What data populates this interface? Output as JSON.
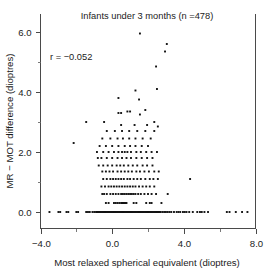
{
  "chart_data": {
    "type": "scatter",
    "title": "Infants under 3 months (n =478)",
    "xlabel": "Most relaxed spherical equivalent (dioptres)",
    "ylabel": "MR − MOT difference (dioptres)",
    "annotation": "r = −0.052",
    "correlation_r": -0.052,
    "n": 478,
    "xlim": [
      -4.0,
      8.0
    ],
    "ylim": [
      -0.55,
      6.6
    ],
    "xticks": [
      -4.0,
      0.0,
      4.0,
      8.0
    ],
    "xticklabels": [
      "−4.0",
      "0.0",
      "4.0",
      "8.0"
    ],
    "yticks": [
      0.0,
      2.0,
      4.0,
      6.0
    ],
    "yticklabels": [
      "0.0",
      "2.0",
      "4.0",
      "6.0"
    ],
    "x_minor_ticks": [
      -2.0,
      2.0,
      6.0
    ],
    "y_minor_ticks": [
      1.0,
      3.0,
      5.0
    ],
    "grid": false,
    "legend": "none",
    "marker": {
      "shape": "square",
      "size_px": 1.9,
      "color": "#111111"
    },
    "points": [
      [
        -3.5,
        0.0
      ],
      [
        -3.0,
        0.0
      ],
      [
        -2.9,
        0.0
      ],
      [
        -2.55,
        0.0
      ],
      [
        -2.45,
        0.0
      ],
      [
        -2.0,
        0.0
      ],
      [
        -1.9,
        0.0
      ],
      [
        -1.45,
        0.0
      ],
      [
        -1.35,
        0.0
      ],
      [
        -1.25,
        0.0
      ],
      [
        -1.1,
        0.0
      ],
      [
        -1.0,
        0.0
      ],
      [
        -0.9,
        0.0
      ],
      [
        -0.85,
        0.0
      ],
      [
        -0.8,
        0.0
      ],
      [
        -0.75,
        0.0
      ],
      [
        -0.7,
        0.0
      ],
      [
        -0.65,
        0.0
      ],
      [
        -0.6,
        0.0
      ],
      [
        -0.55,
        0.0
      ],
      [
        -0.5,
        0.0
      ],
      [
        -0.45,
        0.0
      ],
      [
        -0.4,
        0.0
      ],
      [
        -0.35,
        0.0
      ],
      [
        -0.3,
        0.0
      ],
      [
        -0.25,
        0.0
      ],
      [
        -0.2,
        0.0
      ],
      [
        -0.15,
        0.0
      ],
      [
        -0.1,
        0.0
      ],
      [
        -0.05,
        0.0
      ],
      [
        0.0,
        0.0
      ],
      [
        0.05,
        0.0
      ],
      [
        0.1,
        0.0
      ],
      [
        0.15,
        0.0
      ],
      [
        0.2,
        0.0
      ],
      [
        0.25,
        0.0
      ],
      [
        0.3,
        0.0
      ],
      [
        0.35,
        0.0
      ],
      [
        0.4,
        0.0
      ],
      [
        0.45,
        0.0
      ],
      [
        0.5,
        0.0
      ],
      [
        0.55,
        0.0
      ],
      [
        0.6,
        0.0
      ],
      [
        0.65,
        0.0
      ],
      [
        0.7,
        0.0
      ],
      [
        0.75,
        0.0
      ],
      [
        0.8,
        0.0
      ],
      [
        0.85,
        0.0
      ],
      [
        0.9,
        0.0
      ],
      [
        0.95,
        0.0
      ],
      [
        1.0,
        0.0
      ],
      [
        1.05,
        0.0
      ],
      [
        1.1,
        0.0
      ],
      [
        1.15,
        0.0
      ],
      [
        1.2,
        0.0
      ],
      [
        1.25,
        0.0
      ],
      [
        1.3,
        0.0
      ],
      [
        1.35,
        0.0
      ],
      [
        1.4,
        0.0
      ],
      [
        1.45,
        0.0
      ],
      [
        1.5,
        0.0
      ],
      [
        1.55,
        0.0
      ],
      [
        1.6,
        0.0
      ],
      [
        1.65,
        0.0
      ],
      [
        1.7,
        0.0
      ],
      [
        1.75,
        0.0
      ],
      [
        1.8,
        0.0
      ],
      [
        1.85,
        0.0
      ],
      [
        1.9,
        0.0
      ],
      [
        1.95,
        0.0
      ],
      [
        2.0,
        0.0
      ],
      [
        2.05,
        0.0
      ],
      [
        2.1,
        0.0
      ],
      [
        2.15,
        0.0
      ],
      [
        2.2,
        0.0
      ],
      [
        2.25,
        0.0
      ],
      [
        2.3,
        0.0
      ],
      [
        2.35,
        0.0
      ],
      [
        2.4,
        0.0
      ],
      [
        2.45,
        0.0
      ],
      [
        2.5,
        0.0
      ],
      [
        2.55,
        0.0
      ],
      [
        2.6,
        0.0
      ],
      [
        2.65,
        0.0
      ],
      [
        2.7,
        0.0
      ],
      [
        2.8,
        0.0
      ],
      [
        2.9,
        0.0
      ],
      [
        3.0,
        0.0
      ],
      [
        3.1,
        0.0
      ],
      [
        3.2,
        0.0
      ],
      [
        3.3,
        0.0
      ],
      [
        3.45,
        0.0
      ],
      [
        3.6,
        0.0
      ],
      [
        3.7,
        0.0
      ],
      [
        3.8,
        0.0
      ],
      [
        3.95,
        0.0
      ],
      [
        4.05,
        0.0
      ],
      [
        4.15,
        0.0
      ],
      [
        4.3,
        0.0
      ],
      [
        4.5,
        0.0
      ],
      [
        4.75,
        0.0
      ],
      [
        4.9,
        0.0
      ],
      [
        5.0,
        0.0
      ],
      [
        5.15,
        0.0
      ],
      [
        5.35,
        0.0
      ],
      [
        6.4,
        0.0
      ],
      [
        6.55,
        0.0
      ],
      [
        6.9,
        0.0
      ],
      [
        7.25,
        0.0
      ],
      [
        7.55,
        0.0
      ],
      [
        -0.35,
        0.3
      ],
      [
        -0.2,
        0.3
      ],
      [
        0.1,
        0.3
      ],
      [
        0.2,
        0.3
      ],
      [
        0.3,
        0.3
      ],
      [
        0.4,
        0.3
      ],
      [
        0.5,
        0.3
      ],
      [
        0.55,
        0.3
      ],
      [
        0.6,
        0.3
      ],
      [
        0.65,
        0.3
      ],
      [
        0.7,
        0.3
      ],
      [
        0.75,
        0.3
      ],
      [
        0.8,
        0.3
      ],
      [
        1.2,
        0.3
      ],
      [
        1.35,
        0.3
      ],
      [
        1.9,
        0.3
      ],
      [
        2.1,
        0.3
      ],
      [
        2.2,
        0.3
      ],
      [
        2.75,
        0.3
      ],
      [
        -0.55,
        0.6
      ],
      [
        -0.45,
        0.6
      ],
      [
        -0.3,
        0.6
      ],
      [
        -0.1,
        0.6
      ],
      [
        0.05,
        0.6
      ],
      [
        0.2,
        0.6
      ],
      [
        0.35,
        0.6
      ],
      [
        0.5,
        0.6
      ],
      [
        0.6,
        0.6
      ],
      [
        0.7,
        0.6
      ],
      [
        0.8,
        0.6
      ],
      [
        0.9,
        0.6
      ],
      [
        1.0,
        0.6
      ],
      [
        1.1,
        0.6
      ],
      [
        1.2,
        0.6
      ],
      [
        1.3,
        0.6
      ],
      [
        1.45,
        0.6
      ],
      [
        1.6,
        0.6
      ],
      [
        1.8,
        0.6
      ],
      [
        2.0,
        0.6
      ],
      [
        2.2,
        0.6
      ],
      [
        2.45,
        0.6
      ],
      [
        3.1,
        0.6
      ],
      [
        -0.6,
        0.85
      ],
      [
        -0.4,
        0.85
      ],
      [
        -0.2,
        0.85
      ],
      [
        -0.05,
        0.85
      ],
      [
        0.1,
        0.85
      ],
      [
        0.25,
        0.85
      ],
      [
        0.4,
        0.85
      ],
      [
        0.55,
        0.85
      ],
      [
        0.7,
        0.85
      ],
      [
        0.85,
        0.85
      ],
      [
        1.0,
        0.85
      ],
      [
        1.15,
        0.85
      ],
      [
        1.3,
        0.85
      ],
      [
        1.5,
        0.85
      ],
      [
        1.7,
        0.85
      ],
      [
        1.9,
        0.85
      ],
      [
        2.1,
        0.85
      ],
      [
        2.35,
        0.85
      ],
      [
        -0.5,
        1.1
      ],
      [
        -0.3,
        1.1
      ],
      [
        -0.1,
        1.1
      ],
      [
        0.05,
        1.1
      ],
      [
        0.2,
        1.1
      ],
      [
        0.35,
        1.1
      ],
      [
        0.5,
        1.1
      ],
      [
        0.65,
        1.1
      ],
      [
        0.85,
        1.1
      ],
      [
        1.0,
        1.1
      ],
      [
        1.2,
        1.1
      ],
      [
        1.4,
        1.1
      ],
      [
        1.6,
        1.1
      ],
      [
        1.85,
        1.1
      ],
      [
        2.1,
        1.1
      ],
      [
        2.3,
        1.1
      ],
      [
        2.55,
        1.1
      ],
      [
        4.35,
        1.1
      ],
      [
        -0.55,
        1.35
      ],
      [
        -0.35,
        1.35
      ],
      [
        -0.15,
        1.35
      ],
      [
        0.05,
        1.35
      ],
      [
        0.3,
        1.35
      ],
      [
        0.5,
        1.35
      ],
      [
        0.7,
        1.35
      ],
      [
        0.9,
        1.35
      ],
      [
        1.1,
        1.35
      ],
      [
        1.35,
        1.35
      ],
      [
        1.55,
        1.35
      ],
      [
        1.8,
        1.35
      ],
      [
        2.05,
        1.35
      ],
      [
        2.35,
        1.35
      ],
      [
        2.6,
        1.35
      ],
      [
        -0.75,
        1.55
      ],
      [
        -0.5,
        1.55
      ],
      [
        -0.25,
        1.55
      ],
      [
        0.0,
        1.55
      ],
      [
        0.25,
        1.55
      ],
      [
        0.45,
        1.55
      ],
      [
        0.65,
        1.55
      ],
      [
        0.9,
        1.55
      ],
      [
        1.15,
        1.55
      ],
      [
        1.4,
        1.55
      ],
      [
        1.7,
        1.55
      ],
      [
        1.95,
        1.55
      ],
      [
        2.25,
        1.55
      ],
      [
        -0.8,
        1.8
      ],
      [
        -0.6,
        1.8
      ],
      [
        -0.3,
        1.8
      ],
      [
        0.0,
        1.8
      ],
      [
        0.3,
        1.8
      ],
      [
        0.55,
        1.8
      ],
      [
        0.8,
        1.8
      ],
      [
        1.05,
        1.8
      ],
      [
        1.35,
        1.8
      ],
      [
        1.65,
        1.8
      ],
      [
        1.95,
        1.8
      ],
      [
        2.25,
        1.8
      ],
      [
        -0.85,
        2.0
      ],
      [
        -0.5,
        2.0
      ],
      [
        -0.2,
        2.0
      ],
      [
        0.1,
        2.0
      ],
      [
        0.35,
        2.0
      ],
      [
        0.55,
        2.0
      ],
      [
        0.7,
        2.0
      ],
      [
        0.85,
        2.0
      ],
      [
        1.05,
        2.0
      ],
      [
        1.35,
        2.0
      ],
      [
        1.6,
        2.0
      ],
      [
        1.9,
        2.0
      ],
      [
        2.2,
        2.0
      ],
      [
        2.5,
        2.0
      ],
      [
        -0.7,
        2.2
      ],
      [
        -0.35,
        2.2
      ],
      [
        0.0,
        2.2
      ],
      [
        0.35,
        2.2
      ],
      [
        0.7,
        2.2
      ],
      [
        1.0,
        2.2
      ],
      [
        1.3,
        2.2
      ],
      [
        1.65,
        2.2
      ],
      [
        2.0,
        2.2
      ],
      [
        -2.15,
        2.3
      ],
      [
        -0.55,
        2.45
      ],
      [
        -0.1,
        2.45
      ],
      [
        0.3,
        2.45
      ],
      [
        0.6,
        2.45
      ],
      [
        0.95,
        2.45
      ],
      [
        1.3,
        2.45
      ],
      [
        1.7,
        2.45
      ],
      [
        2.15,
        2.45
      ],
      [
        -0.3,
        2.7
      ],
      [
        0.15,
        2.7
      ],
      [
        0.55,
        2.7
      ],
      [
        0.95,
        2.7
      ],
      [
        1.4,
        2.7
      ],
      [
        1.85,
        2.7
      ],
      [
        2.35,
        2.7
      ],
      [
        -1.45,
        3.0
      ],
      [
        -0.45,
        3.0
      ],
      [
        0.5,
        2.9
      ],
      [
        1.25,
        2.9
      ],
      [
        1.95,
        2.9
      ],
      [
        2.55,
        2.85
      ],
      [
        2.35,
        3.0
      ],
      [
        0.35,
        3.3
      ],
      [
        0.5,
        3.3
      ],
      [
        0.85,
        3.35
      ],
      [
        1.0,
        3.35
      ],
      [
        1.55,
        3.25
      ],
      [
        1.85,
        3.4
      ],
      [
        0.35,
        3.8
      ],
      [
        1.5,
        3.75
      ],
      [
        1.3,
        4.05
      ],
      [
        2.5,
        4.1
      ],
      [
        2.45,
        4.85
      ],
      [
        2.95,
        5.35
      ],
      [
        3.05,
        5.6
      ],
      [
        1.55,
        5.95
      ]
    ]
  }
}
